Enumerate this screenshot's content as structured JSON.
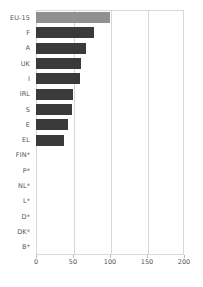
{
  "chart_data": {
    "type": "bar",
    "orientation": "horizontal",
    "title": "",
    "subtitle": "",
    "xlabel": "",
    "ylabel": "",
    "xlim": [
      0,
      200
    ],
    "ylim": null,
    "grid": true,
    "legend": null,
    "xticks": [
      0,
      50,
      100,
      150,
      200
    ],
    "xticklabels": [
      "0",
      "50",
      "100",
      "150",
      "200"
    ],
    "categories": [
      "EU-15",
      "F",
      "A",
      "UK",
      "I",
      "IRL",
      "S",
      "E",
      "EL",
      "FIN*",
      "P*",
      "NL*",
      "L*",
      "D*",
      "DK*",
      "B*"
    ],
    "values": [
      100,
      79,
      67,
      61,
      60,
      50,
      48,
      43,
      38,
      0,
      0,
      0,
      0,
      0,
      0,
      0
    ],
    "annotations": [
      "* indicates no data / zero value"
    ],
    "colors": {
      "accent_bar": "#909090",
      "bar": "#3a3a3a",
      "grid": "#d8d8d8",
      "axis_text": "#555555",
      "background": "#ffffff"
    },
    "highlight_category": "EU-15"
  }
}
